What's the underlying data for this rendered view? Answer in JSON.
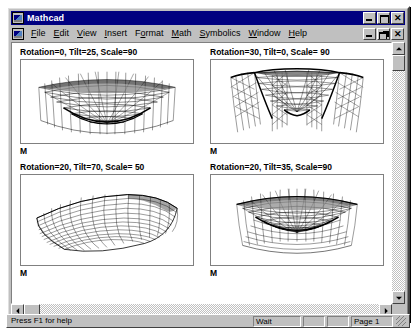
{
  "window": {
    "title": "Mathcad",
    "app_icon": "mathcad-icon",
    "controls": {
      "minimize": "minimize-button",
      "maximize": "maximize-button",
      "close": "close-button",
      "restore": "restore-button"
    }
  },
  "menu": {
    "items": [
      {
        "label": "File",
        "mnemonic": "F"
      },
      {
        "label": "Edit",
        "mnemonic": "E"
      },
      {
        "label": "View",
        "mnemonic": "V"
      },
      {
        "label": "Insert",
        "mnemonic": "I"
      },
      {
        "label": "Format",
        "mnemonic": "o"
      },
      {
        "label": "Math",
        "mnemonic": "M"
      },
      {
        "label": "Symbolics",
        "mnemonic": "S"
      },
      {
        "label": "Window",
        "mnemonic": "W"
      },
      {
        "label": "Help",
        "mnemonic": "H"
      }
    ]
  },
  "worksheet": {
    "plots": [
      {
        "label": "Rotation=0, Tilt=25, Scale=90",
        "variable": "M",
        "rotation": 0,
        "tilt": 25,
        "scale": 90
      },
      {
        "label": "Rotation=30, Tilt=0, Scale= 90",
        "variable": "M",
        "rotation": 30,
        "tilt": 0,
        "scale": 90
      },
      {
        "label": "Rotation=20, Tilt=70, Scale= 50",
        "variable": "M",
        "rotation": 20,
        "tilt": 70,
        "scale": 50
      },
      {
        "label": "Rotation=20, Tilt=35, Scale=90",
        "variable": "M",
        "rotation": 20,
        "tilt": 35,
        "scale": 90
      }
    ]
  },
  "statusbar": {
    "help_text": "Press F1 for help",
    "wait": "Wait",
    "blank1": "",
    "blank2": "",
    "page": "Page 1"
  },
  "scrollbars": {
    "vertical": {
      "up": "scroll-up-arrow",
      "down": "scroll-down-arrow"
    },
    "horizontal": {
      "left": "scroll-left-arrow",
      "right": "scroll-right-arrow"
    }
  },
  "colors": {
    "titlebar": "#000080",
    "face": "#c0c0c0",
    "page": "#ffffff",
    "text": "#000000"
  }
}
